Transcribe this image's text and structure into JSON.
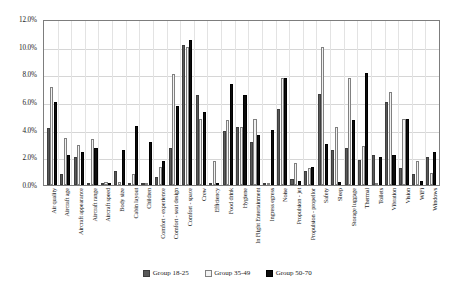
{
  "chart_data": {
    "type": "bar",
    "title": "",
    "subtitle": "",
    "xlabel": "",
    "ylabel": "",
    "ylim": [
      0,
      12
    ],
    "yunit": "%",
    "grid": true,
    "legend_position": "bottom",
    "ytick_labels": [
      "12.0%",
      "10.0%",
      "8.0%",
      "6.0%",
      "4.0%",
      "2.0%",
      "0.0%"
    ],
    "ytick_values": [
      12,
      10,
      8,
      6,
      4,
      2,
      0
    ],
    "categories": [
      "Air quality",
      "Aircraft age",
      "Aircraft appearance",
      "Aircraft range",
      "Aircraft speed",
      "Body size",
      "Cabin layout",
      "Children",
      "Comfort - experience",
      "Comfort - seat design",
      "Comfort - space",
      "Crew",
      "Efficiency",
      "Food drink",
      "Hygiene",
      "In Flight Entertainment",
      "Ingress egress",
      "Noise",
      "Propulsion - jet",
      "Propulsion - propellor",
      "Safety",
      "Sleep",
      "Storage luggage",
      "Thermal",
      "Toilets",
      "Vibration",
      "Vision",
      "WiFi",
      "Windows"
    ],
    "series": [
      {
        "name": "Group 18-25",
        "color": "#595959",
        "values": [
          4.1,
          0.8,
          2.0,
          0.0,
          0.0,
          1.0,
          0.0,
          0.0,
          0.6,
          2.7,
          10.1,
          6.5,
          0.0,
          3.9,
          4.2,
          3.1,
          0.0,
          5.5,
          0.4,
          1.0,
          6.6,
          2.5,
          2.7,
          1.8,
          2.2,
          6.0,
          1.2,
          0.8,
          2.0
        ]
      },
      {
        "name": "Group 35-49",
        "color": "#f2f2f2",
        "values": [
          7.1,
          3.4,
          2.9,
          3.3,
          0.2,
          0.2,
          0.8,
          0.0,
          1.3,
          8.0,
          10.0,
          4.8,
          1.7,
          4.7,
          4.2,
          4.8,
          0.0,
          7.7,
          1.6,
          1.2,
          10.0,
          4.2,
          7.7,
          2.8,
          0.0,
          6.7,
          4.8,
          1.7,
          0.9
        ]
      },
      {
        "name": "Group 50-70",
        "color": "#0d0d0d",
        "values": [
          6.0,
          2.2,
          2.4,
          2.7,
          0.0,
          2.5,
          4.3,
          3.1,
          1.7,
          5.7,
          10.5,
          5.3,
          0.0,
          7.3,
          6.5,
          3.6,
          4.0,
          7.7,
          0.3,
          1.3,
          3.0,
          0.2,
          4.7,
          8.1,
          2.0,
          2.2,
          4.8,
          0.3,
          2.4
        ]
      }
    ]
  },
  "legend": {
    "items": [
      {
        "label": "Group 18-25"
      },
      {
        "label": "Group 35-49"
      },
      {
        "label": "Group 50-70"
      }
    ]
  },
  "caption": {
    "text": ""
  }
}
